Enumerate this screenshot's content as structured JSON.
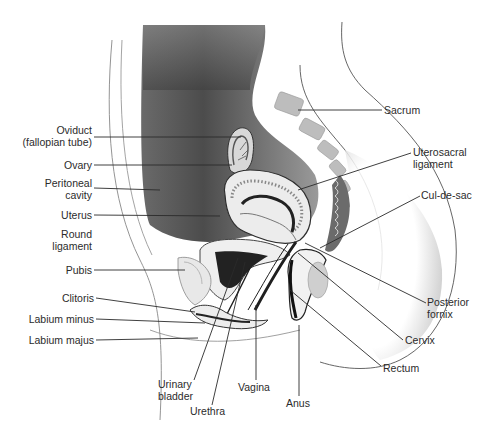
{
  "figure": {
    "type": "anatomical-illustration",
    "colors": {
      "background": "#ffffff",
      "ink": "#2a2a2a",
      "shade_dark": "#3a3a3a",
      "shade_mid": "#8a8a8a",
      "shade_light": "#d6d6d6"
    }
  },
  "labels": {
    "oviduct": {
      "lines": [
        "Oviduct",
        "(fallopian tube)"
      ],
      "x": 92,
      "y": 130,
      "align": "right",
      "target": [
        241,
        137
      ]
    },
    "ovary": {
      "lines": [
        "Ovary"
      ],
      "x": 92,
      "y": 160,
      "align": "right",
      "target": [
        232,
        165
      ]
    },
    "peritoneal": {
      "lines": [
        "Peritoneal",
        "cavity"
      ],
      "x": 92,
      "y": 181,
      "align": "right",
      "target": [
        160,
        190
      ]
    },
    "uterus": {
      "lines": [
        "Uterus"
      ],
      "x": 92,
      "y": 209,
      "align": "right",
      "target": [
        220,
        216
      ]
    },
    "round_lig": {
      "lines": [
        "Round",
        "ligament"
      ],
      "x": 92,
      "y": 229,
      "align": "right",
      "target": null
    },
    "pubis": {
      "lines": [
        "Pubis"
      ],
      "x": 92,
      "y": 264,
      "align": "right",
      "target": [
        185,
        270
      ]
    },
    "clitoris": {
      "lines": [
        "Clitoris"
      ],
      "x": 94,
      "y": 292,
      "align": "right",
      "target": [
        195,
        312
      ]
    },
    "labium_minus": {
      "lines": [
        "Labium minus"
      ],
      "x": 94,
      "y": 313,
      "align": "right",
      "target": [
        205,
        323
      ]
    },
    "labium_majus": {
      "lines": [
        "Labium majus"
      ],
      "x": 94,
      "y": 334,
      "align": "right",
      "target": [
        198,
        338
      ]
    },
    "bladder": {
      "lines": [
        "Urinary",
        "bladder"
      ],
      "x": 158,
      "y": 378,
      "align": "left",
      "target": [
        238,
        258
      ]
    },
    "urethra": {
      "lines": [
        "Urethra"
      ],
      "x": 190,
      "y": 407,
      "align": "left",
      "target": [
        245,
        262
      ]
    },
    "vagina": {
      "lines": [
        "Vagina"
      ],
      "x": 238,
      "y": 382,
      "align": "left",
      "target": [
        256,
        305
      ]
    },
    "anus": {
      "lines": [
        "Anus"
      ],
      "x": 287,
      "y": 398,
      "align": "left",
      "target": [
        299,
        325
      ]
    },
    "rectum": {
      "lines": [
        "Rectum"
      ],
      "x": 383,
      "y": 363,
      "align": "left",
      "target": [
        290,
        290
      ]
    },
    "cervix": {
      "lines": [
        "Cervix"
      ],
      "x": 405,
      "y": 336,
      "align": "left",
      "target": [
        298,
        253
      ]
    },
    "post_fornix": {
      "lines": [
        "Posterior",
        "fornix"
      ],
      "x": 428,
      "y": 297,
      "align": "left",
      "target": [
        305,
        243
      ]
    },
    "cul_de_sac": {
      "lines": [
        "Cul-de-sac"
      ],
      "x": 422,
      "y": 190,
      "align": "left",
      "target": [
        320,
        248
      ]
    },
    "uterosacral": {
      "lines": [
        "Uterosacral",
        "ligament"
      ],
      "x": 413,
      "y": 147,
      "align": "left",
      "target": [
        298,
        190
      ]
    },
    "sacrum": {
      "lines": [
        "Sacrum"
      ],
      "x": 384,
      "y": 104,
      "align": "left",
      "target": [
        298,
        110
      ]
    }
  }
}
